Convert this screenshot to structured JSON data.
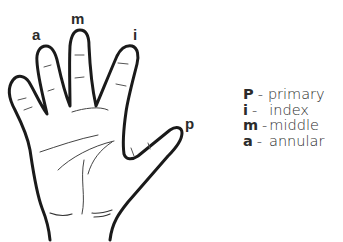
{
  "diagram": {
    "finger_labels": {
      "a": "a",
      "m": "m",
      "i": "i",
      "p": "p"
    },
    "legend": [
      {
        "key": "P",
        "separator": "-",
        "name": "primary"
      },
      {
        "key": "i",
        "separator": "-",
        "name": "index"
      },
      {
        "key": "m",
        "separator": "-",
        "name": "middle"
      },
      {
        "key": "a",
        "separator": "-",
        "name": "annular"
      }
    ],
    "colors": {
      "outline": "#1a1a1a",
      "text": "#2b2b2b",
      "background": "#ffffff"
    }
  }
}
